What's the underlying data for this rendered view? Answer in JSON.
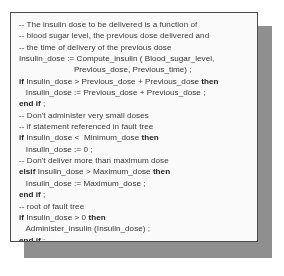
{
  "code_panel": {
    "language": "Ada",
    "border_color": "#4a4a4a",
    "shadow_color": "#8f8f8f",
    "background_color": "#fefefe",
    "text_color": "#313131",
    "lines": [
      {
        "indent": 0,
        "segments": [
          {
            "text": "-- The insulin dose to be delivered is a function of",
            "bold": false
          }
        ],
        "comment": true
      },
      {
        "indent": 0,
        "segments": [
          {
            "text": "-- blood sugar level, the previous dose delivered and",
            "bold": false
          }
        ],
        "comment": true
      },
      {
        "indent": 0,
        "segments": [
          {
            "text": "-- the time of delivery of the previous dose",
            "bold": false
          }
        ],
        "comment": true
      },
      {
        "indent": 0,
        "segments": [
          {
            "text": "Insulin_dose := Compute_insulin ( Blood_sugar_level,",
            "bold": false
          }
        ],
        "comment": false
      },
      {
        "indent": 0,
        "segments": [
          {
            "text": "                        Previous_dose, Previous_time) ;",
            "bold": false
          }
        ],
        "comment": false
      },
      {
        "indent": 0,
        "segments": [
          {
            "text": "if",
            "bold": true
          },
          {
            "text": " Insulin_dose > Previous_dose + Previous_dose ",
            "bold": false
          },
          {
            "text": "then",
            "bold": true
          }
        ],
        "comment": false
      },
      {
        "indent": 0,
        "segments": [
          {
            "text": "   Insulin_dose := Previous_dose + Previous_dose ;",
            "bold": false
          }
        ],
        "comment": false
      },
      {
        "indent": 0,
        "segments": [
          {
            "text": "end if",
            "bold": true
          },
          {
            "text": " ;",
            "bold": false
          }
        ],
        "comment": false
      },
      {
        "indent": 0,
        "segments": [
          {
            "text": "-- Don't administer very small doses",
            "bold": false
          }
        ],
        "comment": true
      },
      {
        "indent": 0,
        "segments": [
          {
            "text": "-- if statement referenced in fault tree",
            "bold": false
          }
        ],
        "comment": true
      },
      {
        "indent": 0,
        "segments": [
          {
            "text": "if",
            "bold": true
          },
          {
            "text": " Insulin_dose <  Minimum_dose ",
            "bold": false
          },
          {
            "text": "then",
            "bold": true
          }
        ],
        "comment": false
      },
      {
        "indent": 0,
        "segments": [
          {
            "text": "   Insulin_dose := 0 ;",
            "bold": false
          }
        ],
        "comment": false
      },
      {
        "indent": 0,
        "segments": [
          {
            "text": "-- Don't deliver more than maximum dose",
            "bold": false
          }
        ],
        "comment": true
      },
      {
        "indent": 0,
        "segments": [
          {
            "text": "elsif",
            "bold": true
          },
          {
            "text": " Insulin_dose > Maximum_dose ",
            "bold": false
          },
          {
            "text": "then",
            "bold": true
          }
        ],
        "comment": false
      },
      {
        "indent": 0,
        "segments": [
          {
            "text": "   Insulin_dose := Maximum_dose ;",
            "bold": false
          }
        ],
        "comment": false
      },
      {
        "indent": 0,
        "segments": [
          {
            "text": "end if",
            "bold": true
          },
          {
            "text": " ;",
            "bold": false
          }
        ],
        "comment": false
      },
      {
        "indent": 0,
        "segments": [
          {
            "text": "-- root of fault tree",
            "bold": false
          }
        ],
        "comment": true
      },
      {
        "indent": 0,
        "segments": [
          {
            "text": "if",
            "bold": true
          },
          {
            "text": " Insulin_dose > 0 ",
            "bold": false
          },
          {
            "text": "then",
            "bold": true
          }
        ],
        "comment": false
      },
      {
        "indent": 0,
        "segments": [
          {
            "text": "   Administer_insulin (Insulin_dose) ;",
            "bold": false
          }
        ],
        "comment": false
      },
      {
        "indent": 0,
        "segments": [
          {
            "text": "end if",
            "bold": true
          },
          {
            "text": " ;",
            "bold": false
          }
        ],
        "comment": false
      }
    ]
  }
}
